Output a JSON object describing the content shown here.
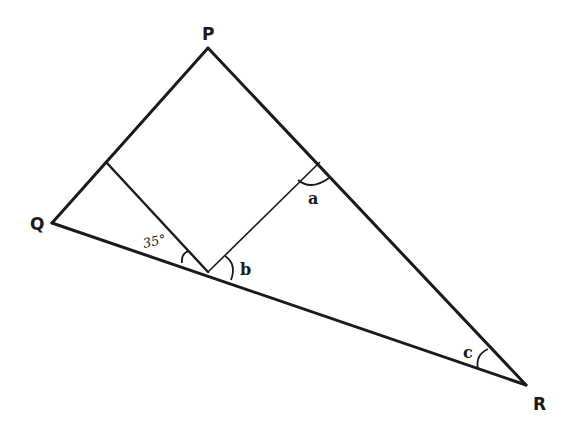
{
  "diagram": {
    "vertices": {
      "P": {
        "label": "P",
        "x": 208,
        "y": 48
      },
      "Q": {
        "label": "Q",
        "x": 52,
        "y": 223
      },
      "R": {
        "label": "R",
        "x": 526,
        "y": 385
      }
    },
    "points": {
      "left_foot": {
        "x": 106,
        "y": 162
      },
      "bottom": {
        "x": 208,
        "y": 272
      },
      "right_foot": {
        "x": 320,
        "y": 162
      }
    },
    "angles": {
      "given": {
        "label": "35°"
      },
      "a": {
        "label": "a"
      },
      "b": {
        "label": "b"
      },
      "c": {
        "label": "c"
      }
    },
    "stroke_color": "#1a1a1a",
    "background": "#ffffff"
  }
}
